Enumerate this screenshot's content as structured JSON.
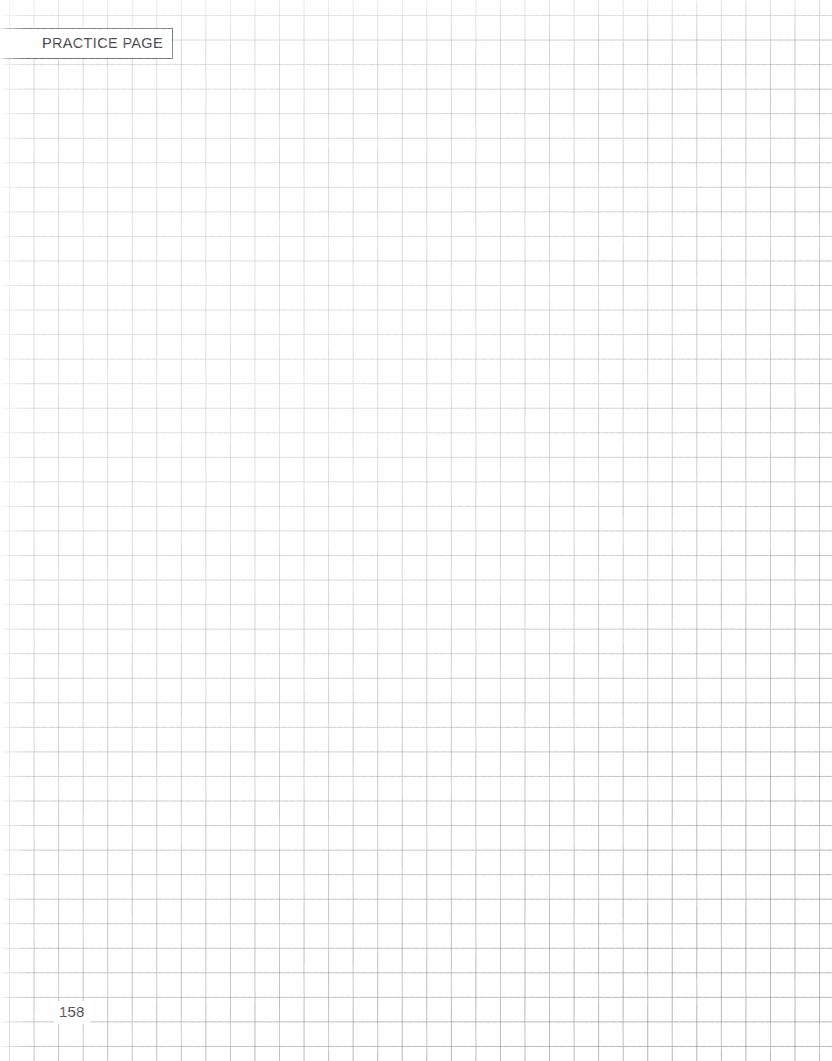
{
  "page": {
    "kind": "grid-practice-worksheet",
    "width": 832,
    "height": 1061,
    "background_color": "#fefefe"
  },
  "header": {
    "tab_label": "PRACTICE PAGE",
    "border_color": "#58585c",
    "text_color": "#242428",
    "fill_color": "#ffffff"
  },
  "grid": {
    "cell_size_px": 24.55,
    "origin_x_px": 9,
    "origin_y_px": 15,
    "line_color": "#96989c"
  },
  "work_area": {
    "content": "",
    "placeholder": ""
  },
  "footer": {
    "page_number": "158",
    "text_color": "#4a4a4e"
  }
}
